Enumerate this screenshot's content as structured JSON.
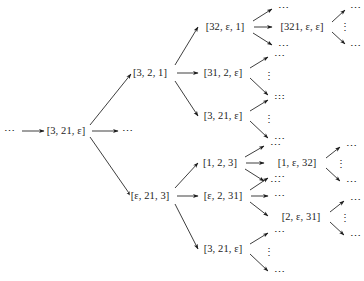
{
  "figure": {
    "kind": "derivation-tree",
    "stroke_color": "#1c1c1c",
    "background_color": "#ffffff",
    "ellipsis": "⋯",
    "vertical_ellipsis": "⋮",
    "epsilon": "ε"
  },
  "nodes": {
    "lead_dots": "⋯",
    "root": "[3, 21, ε]",
    "root_right_dots": "⋯",
    "upper_branch": "[3, 2, 1]",
    "upper_children": [
      "[32, ε, 1]",
      "[31, 2, ε]",
      "[3, 21, ε]"
    ],
    "upper_grandchild": "[321, ε, ε]",
    "lower_branch": "[ε, 21, 3]",
    "lower_children": [
      "[1, 2, 3]",
      "[ε, 2, 31]",
      "[3, 21, ε]"
    ],
    "lower_grandchild_a": "[1, ε, 32]",
    "lower_grandchild_b": "[2, ε, 31]"
  },
  "leaf_dots": {
    "d1": "⋯",
    "d2": "⋯",
    "d3": "⋯",
    "d4": "⋯",
    "d5": "⋯",
    "d6": "⋯",
    "d7": "⋯",
    "d8": "⋯",
    "d9": "⋯",
    "d10": "⋯",
    "d11": "⋯",
    "d12": "⋯",
    "d13": "⋯",
    "d14": "⋯",
    "d15": "⋯",
    "d16": "⋯",
    "d17": "⋯",
    "d18": "⋯",
    "d19": "⋯",
    "d20": "⋯",
    "d21": "⋯",
    "d22": "⋯"
  },
  "vdots": {
    "v1": "⋮",
    "v2": "⋮",
    "v3": "⋮",
    "v4": "⋮",
    "v5": "⋮",
    "v6": "⋮",
    "v7": "⋮"
  }
}
